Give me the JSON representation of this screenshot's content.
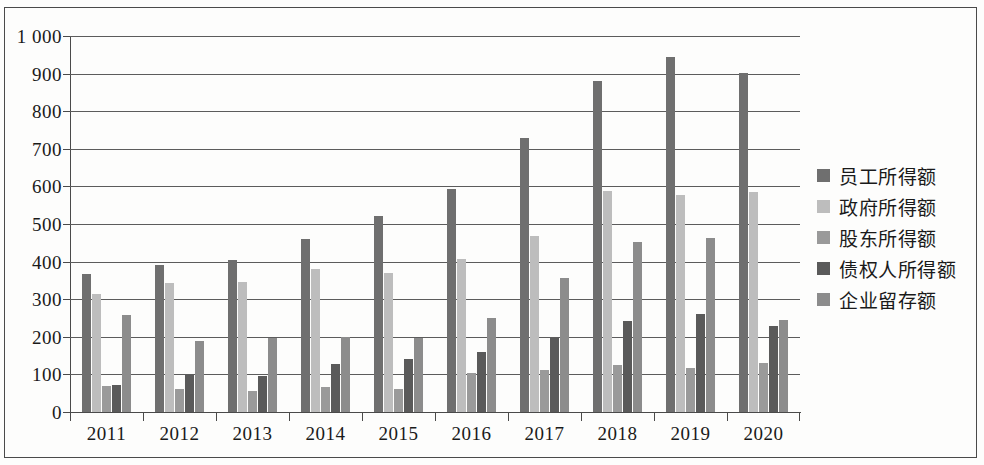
{
  "chart_data": {
    "type": "bar",
    "title": "",
    "subtitle": "",
    "xlabel": "",
    "ylabel": "",
    "grid": true,
    "legend_position": "right",
    "ylim": [
      0,
      1000
    ],
    "ytick_step": 100,
    "ytick_labels": [
      "1 000",
      "900",
      "800",
      "700",
      "600",
      "500",
      "400",
      "300",
      "200",
      "100",
      "0"
    ],
    "ytick_values": [
      1000,
      900,
      800,
      700,
      600,
      500,
      400,
      300,
      200,
      100,
      0
    ],
    "categories": [
      "2011",
      "2012",
      "2013",
      "2014",
      "2015",
      "2016",
      "2017",
      "2018",
      "2019",
      "2020"
    ],
    "series": [
      {
        "name": "员工所得额",
        "color": "#6f6f6f",
        "values": [
          368,
          392,
          404,
          460,
          522,
          592,
          730,
          881,
          944,
          901
        ]
      },
      {
        "name": "政府所得额",
        "color": "#bdbdbd",
        "values": [
          314,
          342,
          345,
          381,
          369,
          408,
          469,
          587,
          578,
          584
        ]
      },
      {
        "name": "股东所得额",
        "color": "#9a9a9a",
        "values": [
          70,
          61,
          55,
          66,
          60,
          103,
          112,
          124,
          117,
          131
        ]
      },
      {
        "name": "债权人所得额",
        "color": "#5a5a5a",
        "values": [
          72,
          99,
          97,
          128,
          141,
          159,
          196,
          243,
          260,
          228
        ]
      },
      {
        "name": "企业留存额",
        "color": "#8c8c8c",
        "values": [
          259,
          188,
          198,
          200,
          198,
          249,
          357,
          452,
          462,
          245
        ]
      }
    ]
  },
  "legend": {
    "items": [
      {
        "label": "员工所得额",
        "color": "#6f6f6f"
      },
      {
        "label": "政府所得额",
        "color": "#bdbdbd"
      },
      {
        "label": "股东所得额",
        "color": "#9a9a9a"
      },
      {
        "label": "债权人所得额",
        "color": "#5a5a5a"
      },
      {
        "label": "企业留存额",
        "color": "#8c8c8c"
      }
    ]
  },
  "axes": {
    "y_max_label": "1 000",
    "y_min_label": "0"
  }
}
